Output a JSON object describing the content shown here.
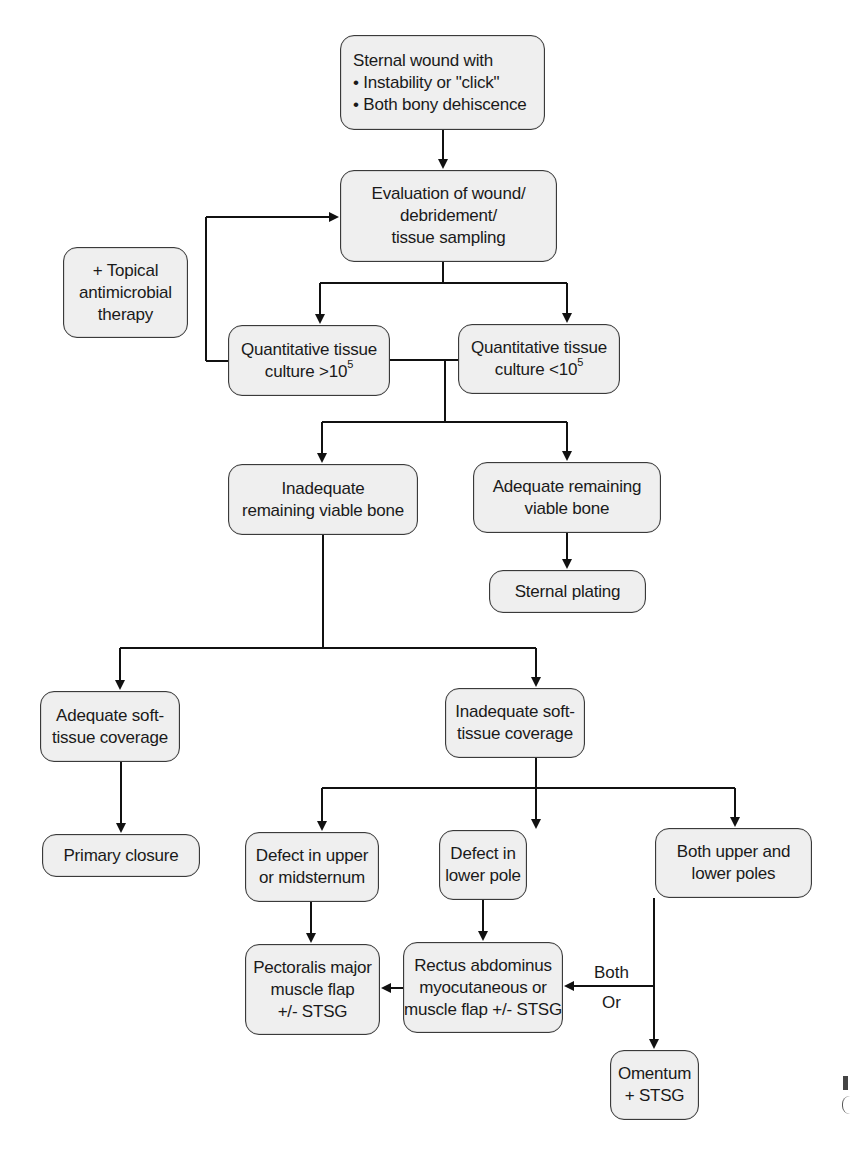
{
  "diagram": {
    "type": "flowchart",
    "nodes": {
      "sternal_wound": {
        "title": "Sternal wound with",
        "bullets": [
          "• Instability or \"click\"",
          "• Both bony dehiscence"
        ]
      },
      "evaluation": {
        "lines": [
          "Evaluation of wound/",
          "debridement/",
          "tissue sampling"
        ]
      },
      "topical": {
        "lines": [
          "+ Topical",
          "antimicrobial",
          "therapy"
        ]
      },
      "culture_high": {
        "line1": "Quantitative tissue",
        "line2_prefix": "culture >10",
        "line2_sup": "5"
      },
      "culture_low": {
        "line1": "Quantitative tissue",
        "line2_prefix": "culture <10",
        "line2_sup": "5"
      },
      "inadequate_bone": {
        "lines": [
          "Inadequate",
          "remaining viable bone"
        ]
      },
      "adequate_bone": {
        "lines": [
          "Adequate remaining",
          "viable bone"
        ]
      },
      "sternal_plating": {
        "lines": [
          "Sternal plating"
        ]
      },
      "adequate_soft": {
        "lines": [
          "Adequate soft-",
          "tissue coverage"
        ]
      },
      "inadequate_soft": {
        "lines": [
          "Inadequate soft-",
          "tissue coverage"
        ]
      },
      "primary_closure": {
        "lines": [
          "Primary closure"
        ]
      },
      "defect_upper": {
        "lines": [
          "Defect in upper",
          "or midsternum"
        ]
      },
      "defect_lower": {
        "lines": [
          "Defect in",
          "lower pole"
        ]
      },
      "both_poles": {
        "lines": [
          "Both upper and",
          "lower poles"
        ]
      },
      "pectoralis": {
        "lines": [
          "Pectoralis major",
          "muscle flap",
          "+/- STSG"
        ]
      },
      "rectus": {
        "lines": [
          "Rectus abdominus",
          "myocutaneous or",
          "muscle flap +/- STSG"
        ]
      },
      "omentum": {
        "lines": [
          "Omentum",
          "+ STSG"
        ]
      }
    },
    "edge_labels": {
      "both": "Both",
      "or": "Or"
    },
    "edges": [
      [
        "sternal_wound",
        "evaluation"
      ],
      [
        "evaluation",
        "culture_high"
      ],
      [
        "evaluation",
        "culture_low"
      ],
      [
        "culture_high",
        "evaluation",
        "loop via topical antimicrobial therapy"
      ],
      [
        "culture_low",
        "inadequate_bone"
      ],
      [
        "culture_low",
        "adequate_bone"
      ],
      [
        "adequate_bone",
        "sternal_plating"
      ],
      [
        "inadequate_bone",
        "adequate_soft"
      ],
      [
        "inadequate_bone",
        "inadequate_soft"
      ],
      [
        "adequate_soft",
        "primary_closure"
      ],
      [
        "inadequate_soft",
        "defect_upper"
      ],
      [
        "inadequate_soft",
        "defect_lower"
      ],
      [
        "inadequate_soft",
        "both_poles"
      ],
      [
        "defect_upper",
        "pectoralis"
      ],
      [
        "defect_lower",
        "rectus"
      ],
      [
        "rectus",
        "pectoralis"
      ],
      [
        "both_poles",
        "rectus",
        "Both / Or"
      ],
      [
        "both_poles",
        "omentum"
      ]
    ],
    "colors": {
      "box_fill": "#efefef",
      "box_border": "#3a3a3a",
      "line": "#111111",
      "background": "#ffffff"
    }
  }
}
